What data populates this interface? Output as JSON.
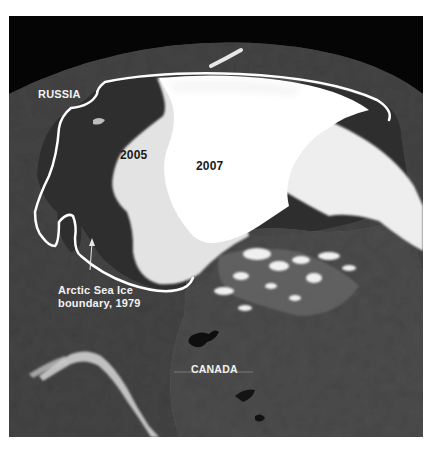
{
  "map": {
    "title": "Arctic sea ice extent",
    "colors": {
      "space": "#050505",
      "land": "#4a4a4a",
      "ocean": "#2f2f2f",
      "ice_2007": "#ffffff",
      "ice_2005": "#e4e4e4",
      "boundary_1979": "#ffffff",
      "label_light": "#f2f2f2",
      "label_dark": "#1a1a1a"
    },
    "labels": {
      "russia": "RUSSIA",
      "ice_2005": "2005",
      "ice_2007": "2007",
      "boundary_line1": "Arctic Sea Ice",
      "boundary_line2": "boundary, 1979",
      "canada": "CANADA"
    },
    "legend_features": [
      {
        "name": "Arctic Sea Ice boundary",
        "year": 1979
      },
      {
        "name": "Sea ice extent",
        "year": 2005
      },
      {
        "name": "Sea ice extent",
        "year": 2007
      }
    ]
  }
}
